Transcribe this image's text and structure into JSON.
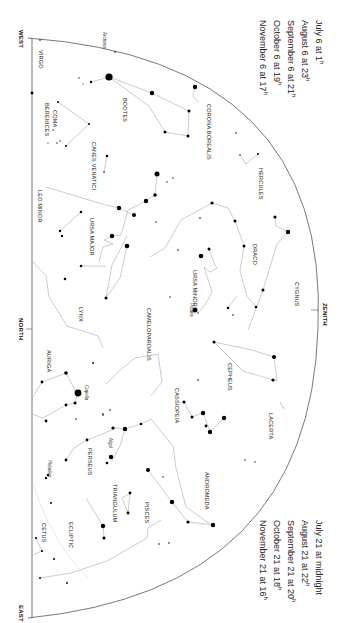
{
  "directions": {
    "west": "WEST",
    "north": "NORTH",
    "east": "EAST",
    "zenith": "ZENITH"
  },
  "times_left": [
    {
      "text": "July 6 at",
      "hour": "1",
      "suffix": "h"
    },
    {
      "text": "August 6 at",
      "hour": "23",
      "suffix": "h"
    },
    {
      "text": "September 6 at",
      "hour": "21",
      "suffix": "h"
    },
    {
      "text": "October 6 at",
      "hour": "19",
      "suffix": "h"
    },
    {
      "text": "November 6 at",
      "hour": "17",
      "suffix": "h"
    }
  ],
  "times_right": [
    {
      "text": "July 21 at",
      "hour": "midnight",
      "suffix": ""
    },
    {
      "text": "August 21 at",
      "hour": "22",
      "suffix": "h"
    },
    {
      "text": "September 21 at",
      "hour": "20",
      "suffix": "h"
    },
    {
      "text": "October 21 at",
      "hour": "18",
      "suffix": "h"
    },
    {
      "text": "November 21 at",
      "hour": "16",
      "suffix": "h"
    }
  ],
  "constellations": [
    {
      "name": "VIRGO",
      "x": 44,
      "y": 50
    },
    {
      "name": "BOOTES",
      "x": 128,
      "y": 98
    },
    {
      "name": "CORONA BOREALIS",
      "x": 212,
      "y": 104
    },
    {
      "name": "COMA",
      "x": 58,
      "y": 110
    },
    {
      "name": "BERENICES",
      "x": 50,
      "y": 103
    },
    {
      "name": "CANES VENATICI",
      "x": 97,
      "y": 142
    },
    {
      "name": "HERCULES",
      "x": 264,
      "y": 168
    },
    {
      "name": "LEO MINOR",
      "x": 43,
      "y": 190
    },
    {
      "name": "URSA MAJOR",
      "x": 95,
      "y": 218
    },
    {
      "name": "DRACO",
      "x": 258,
      "y": 244
    },
    {
      "name": "URSA MINOR",
      "x": 198,
      "y": 270
    },
    {
      "name": "LYNX",
      "x": 84,
      "y": 307
    },
    {
      "name": "CYGNUS",
      "x": 300,
      "y": 282
    },
    {
      "name": "CAMELOPARDALIS",
      "x": 152,
      "y": 308
    },
    {
      "name": "AURIGA",
      "x": 52,
      "y": 350
    },
    {
      "name": "CEPHEUS",
      "x": 233,
      "y": 363
    },
    {
      "name": "CASSIOPEIA",
      "x": 180,
      "y": 388
    },
    {
      "name": "LACERTA",
      "x": 274,
      "y": 413
    },
    {
      "name": "PERSEUS",
      "x": 93,
      "y": 448
    },
    {
      "name": "ANDROMEDA",
      "x": 210,
      "y": 472
    },
    {
      "name": "TRIANGULUM",
      "x": 118,
      "y": 484
    },
    {
      "name": "PISCES",
      "x": 150,
      "y": 502
    },
    {
      "name": "CETUS",
      "x": 47,
      "y": 523
    },
    {
      "name": "ECLIPTIC",
      "x": 74,
      "y": 522
    }
  ],
  "star_names": [
    {
      "name": "Arcturus",
      "x": 107,
      "y": 32
    },
    {
      "name": "Polaris",
      "x": 194,
      "y": 303
    },
    {
      "name": "Capella",
      "x": 89,
      "y": 385
    },
    {
      "name": "Algol",
      "x": 113,
      "y": 438
    },
    {
      "name": "Pleiades",
      "x": 52,
      "y": 460
    }
  ],
  "colors": {
    "background": "#ffffff",
    "lines": "#999999",
    "horizon": "#555555",
    "stars": "#000000",
    "text": "#222222"
  }
}
